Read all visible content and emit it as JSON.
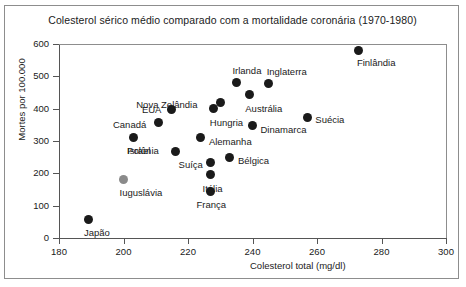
{
  "chart_data": {
    "type": "scatter",
    "title": "Colesterol sérico médio comparado com a mortalidade coronária (1970-1980)",
    "xlabel": "Colesterol total (mg/dl)",
    "ylabel": "Mortes por 100.000",
    "xlim": [
      180,
      300
    ],
    "ylim": [
      0,
      600
    ],
    "xticks": [
      180,
      200,
      220,
      240,
      260,
      280,
      300
    ],
    "yticks": [
      0,
      100,
      200,
      300,
      400,
      500,
      600
    ],
    "grid": false,
    "legend": "none",
    "points": [
      {
        "label": "Finlândia",
        "x": 273,
        "y": 580,
        "color": "#1a1a1a",
        "label_dx": -2,
        "label_dy": 13
      },
      {
        "label": "Irlanda",
        "x": 235,
        "y": 480,
        "color": "#1a1a1a",
        "label_dx": -4,
        "label_dy": -12
      },
      {
        "label": "Inglaterra",
        "x": 245,
        "y": 477,
        "color": "#1a1a1a",
        "label_dx": -2,
        "label_dy": -12
      },
      {
        "label": "Austrália",
        "x": 239,
        "y": 443,
        "color": "#1a1a1a",
        "label_dx": -4,
        "label_dy": 14
      },
      {
        "label": "Nova Zelândia",
        "x": 230,
        "y": 420,
        "color": "#1a1a1a",
        "label_dx": -84,
        "label_dy": 3
      },
      {
        "label": "Hungria",
        "x": 228,
        "y": 400,
        "color": "#1a1a1a",
        "label_dx": -4,
        "label_dy": 14
      },
      {
        "label": "EUA",
        "x": 215,
        "y": 396,
        "color": "#1a1a1a",
        "label_dx": -30,
        "label_dy": 0
      },
      {
        "label": "Suécia",
        "x": 257,
        "y": 373,
        "color": "#1a1a1a",
        "label_dx": 8,
        "label_dy": 3
      },
      {
        "label": "Canadá",
        "x": 211,
        "y": 358,
        "color": "#1a1a1a",
        "label_dx": -46,
        "label_dy": 3
      },
      {
        "label": "Dinamarca",
        "x": 240,
        "y": 347,
        "color": "#1a1a1a",
        "label_dx": 8,
        "label_dy": 4
      },
      {
        "label": "Israel",
        "x": 203,
        "y": 312,
        "color": "#1a1a1a",
        "label_dx": -6,
        "label_dy": 14
      },
      {
        "label": "Alemanha",
        "x": 224,
        "y": 310,
        "color": "#1a1a1a",
        "label_dx": 8,
        "label_dy": 4
      },
      {
        "label": "Polônia",
        "x": 216,
        "y": 268,
        "color": "#1a1a1a",
        "label_dx": -48,
        "label_dy": 0
      },
      {
        "label": "Bélgica",
        "x": 233,
        "y": 248,
        "color": "#1a1a1a",
        "label_dx": 8,
        "label_dy": 3
      },
      {
        "label": "Suíça",
        "x": 227,
        "y": 233,
        "color": "#1a1a1a",
        "label_dx": -32,
        "label_dy": 2
      },
      {
        "label": "Itália",
        "x": 227,
        "y": 195,
        "color": "#1a1a1a",
        "label_dx": -8,
        "label_dy": 14
      },
      {
        "label": "Iuguslávia",
        "x": 200,
        "y": 182,
        "color": "#8a8a8a",
        "label_dx": -4,
        "label_dy": 14
      },
      {
        "label": "França",
        "x": 227,
        "y": 145,
        "color": "#1a1a1a",
        "label_dx": -14,
        "label_dy": 14
      },
      {
        "label": "Japão",
        "x": 189,
        "y": 58,
        "color": "#1a1a1a",
        "label_dx": -4,
        "label_dy": 14
      }
    ]
  }
}
